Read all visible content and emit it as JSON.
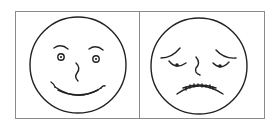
{
  "figure": {
    "panels": [
      {
        "label": "happy face",
        "expression": "smiling"
      },
      {
        "label": "sad face",
        "expression": "worried / sad"
      }
    ],
    "colors": {
      "stroke": "#222222",
      "border": "#8a8a8a",
      "background": "#ffffff"
    }
  }
}
